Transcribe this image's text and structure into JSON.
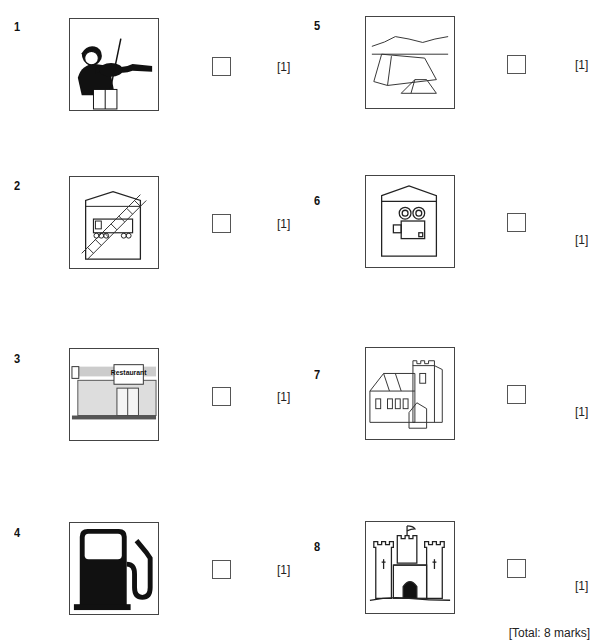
{
  "questions": [
    {
      "number": "1",
      "picture": "violinist-concert",
      "mark": "[1]"
    },
    {
      "number": "2",
      "picture": "railway-museum-sign",
      "mark": "[1]"
    },
    {
      "number": "3",
      "picture": "restaurant-storefront",
      "mark": "[1]"
    },
    {
      "number": "4",
      "picture": "petrol-pump-sign",
      "mark": "[1]"
    },
    {
      "number": "5",
      "picture": "campsite-tents",
      "mark": "[1]"
    },
    {
      "number": "6",
      "picture": "cinema-sign",
      "mark": "[1]"
    },
    {
      "number": "7",
      "picture": "church",
      "mark": "[1]"
    },
    {
      "number": "8",
      "picture": "castle",
      "mark": "[1]"
    }
  ],
  "restaurant_sign_text": "Restaurant",
  "total": "[Total: 8 marks]"
}
